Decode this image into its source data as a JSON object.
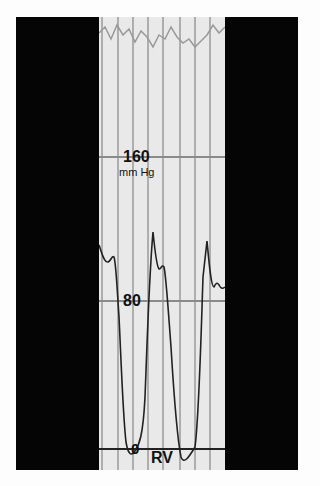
{
  "figure": {
    "scale_labels": {
      "high": "160",
      "unit": "mm Hg",
      "mid": "80",
      "zero": "0"
    },
    "chamber_label": "RV",
    "colors": {
      "background_frame": "#050505",
      "paper": "#e9e9e9",
      "grid": "#9a9a9a",
      "trace": "#222222"
    }
  }
}
